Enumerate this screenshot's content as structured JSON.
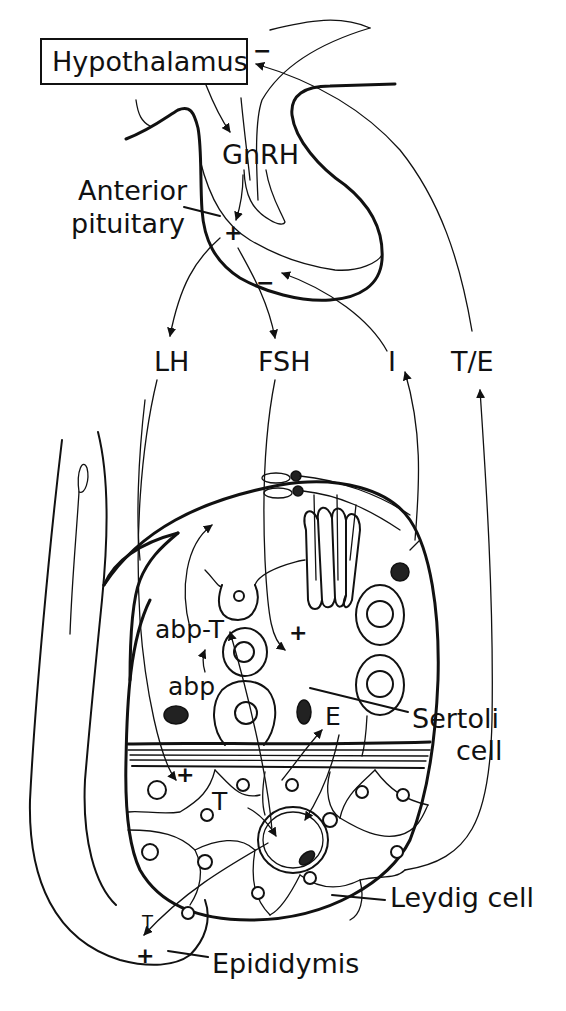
{
  "diagram": {
    "labels": {
      "hypothalamus": "Hypothalamus",
      "gnrh": "GnRH",
      "anterior_pituitary_line1": "Anterior",
      "anterior_pituitary_line2": "pituitary",
      "lh": "LH",
      "fsh": "FSH",
      "inhibin": "I",
      "testosterone_estrogen": "T/E",
      "abp_t": "abp-T",
      "abp": "abp",
      "estradiol": "E",
      "testosterone_leydig": "T",
      "sertoli_line1": "Sertoli",
      "sertoli_line2": "cell",
      "leydig": "Leydig cell",
      "testosterone_epididymis": "T",
      "epididymis": "Epididymis"
    },
    "signs": {
      "hypothalamus_feedback": "−",
      "pituitary_stimulation": "+",
      "pituitary_inhibin_feedback": "−",
      "fsh_sertoli_stimulation": "+",
      "lh_leydig_stimulation": "+",
      "epididymis_stimulation": "+"
    },
    "colors": {
      "ink": "#111111",
      "background": "#ffffff"
    }
  }
}
